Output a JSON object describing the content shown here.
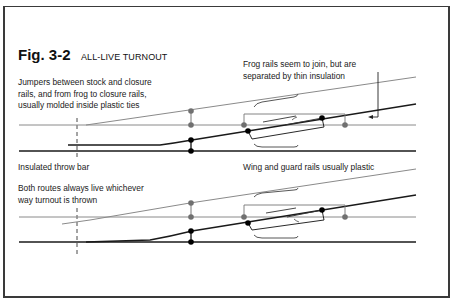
{
  "figure": {
    "number": "Fig. 3-2",
    "title": "ALL-LIVE TURNOUT"
  },
  "annotations": {
    "jumpers_line1": "Jumpers between stock and closure",
    "jumpers_line2": "rails, and from frog to closure rails,",
    "jumpers_line3": "usually molded inside plastic ties",
    "frog_line1": "Frog rails seem to join, but are",
    "frog_line2": "separated by thin insulation",
    "throw_bar": "Insulated throw bar",
    "routes_line1": "Both routes always live whichever",
    "routes_line2": "way turnout is thrown",
    "wing_guard": "Wing and guard rails usually plastic"
  },
  "colors": {
    "frame": "#3a3a3a",
    "rail_gray": "#8a8a8a",
    "rail_black": "#1a1a1a",
    "dot_gray": "#707070",
    "dot_black": "#000000"
  },
  "diagrams": [
    {
      "name": "top-turnout",
      "throw_bar_x": 77
    },
    {
      "name": "bottom-turnout",
      "throw_bar_x": 77
    }
  ]
}
